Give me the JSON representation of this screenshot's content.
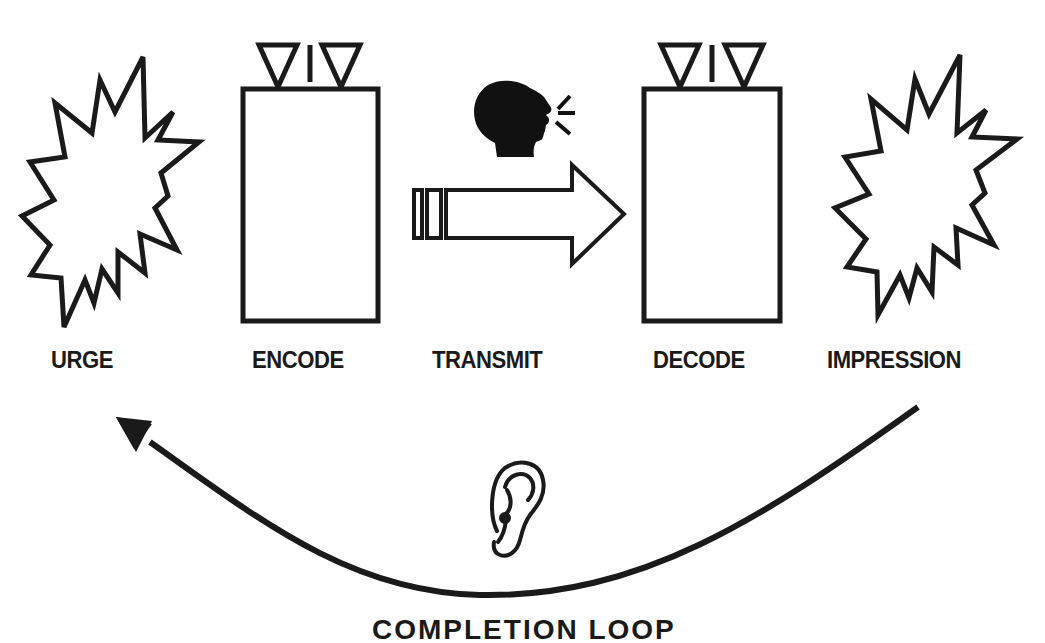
{
  "diagram": {
    "stages": [
      {
        "id": "urge",
        "label": "URGE",
        "icon": "starburst-icon"
      },
      {
        "id": "encode",
        "label": "ENCODE",
        "icon": "antenna-box-icon"
      },
      {
        "id": "transmit",
        "label": "TRANSMIT",
        "icon": "speaking-head-arrow-icon"
      },
      {
        "id": "decode",
        "label": "DECODE",
        "icon": "antenna-box-icon"
      },
      {
        "id": "impression",
        "label": "IMPRESSION",
        "icon": "starburst-icon"
      }
    ],
    "loop": {
      "label": "COMPLETION LOOP",
      "icon": "ear-icon",
      "direction": "from IMPRESSION back to URGE"
    },
    "colors": {
      "stroke": "#1a1a1a",
      "fill": "#ffffff",
      "background": "#ffffff"
    }
  }
}
